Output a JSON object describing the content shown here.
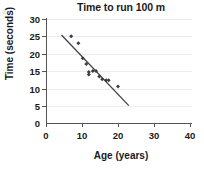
{
  "figure": {
    "corner_mark": "a",
    "title": "Time to run 100 m",
    "xlabel": "Age (years)",
    "ylabel": "Time (seconds)",
    "point_color": "#3c3c46",
    "line_color": "#40404a",
    "grid_color": "#ececec",
    "axis_color": "#555555"
  },
  "chart_data": {
    "type": "scatter",
    "title": "Time to run 100 m",
    "xlabel": "Age (years)",
    "ylabel": "Time (seconds)",
    "xlim": [
      0,
      40
    ],
    "ylim": [
      0,
      30
    ],
    "xticks": [
      0,
      10,
      20,
      30,
      40
    ],
    "yticks": [
      0,
      5,
      10,
      15,
      20,
      25,
      30
    ],
    "xtick_labels": [
      "0",
      "10",
      "20",
      "30",
      "40"
    ],
    "ytick_labels": [
      "0",
      "5",
      "10",
      "15",
      "20",
      "25",
      "30"
    ],
    "grid": "horizontal",
    "legend": "none",
    "series": [
      {
        "name": "Runners",
        "marker": "diamond",
        "points": [
          {
            "x": 7.0,
            "y": 25.0
          },
          {
            "x": 9.0,
            "y": 23.0
          },
          {
            "x": 10.2,
            "y": 18.7
          },
          {
            "x": 11.2,
            "y": 17.0
          },
          {
            "x": 11.9,
            "y": 14.7
          },
          {
            "x": 11.9,
            "y": 14.0
          },
          {
            "x": 13.0,
            "y": 15.0
          },
          {
            "x": 13.9,
            "y": 15.0
          },
          {
            "x": 14.8,
            "y": 13.4
          },
          {
            "x": 15.6,
            "y": 12.6
          },
          {
            "x": 16.7,
            "y": 12.3
          },
          {
            "x": 17.4,
            "y": 12.3
          },
          {
            "x": 20.0,
            "y": 10.5
          }
        ]
      }
    ],
    "trend_line": {
      "name": "Line of best fit",
      "x_start": 4.3,
      "y_start": 25.4,
      "x_end": 23.0,
      "y_end": 5.0
    }
  }
}
